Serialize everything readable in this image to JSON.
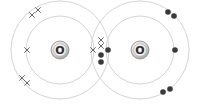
{
  "diagram": {
    "colors": {
      "background": "#ffffff",
      "shell": "#d4d4d4",
      "cross": "#555555",
      "dot": "#3a3a3a",
      "nucleus_fill": "#e6e6e6",
      "nucleus_stroke": "#8a8a8a"
    },
    "atoms": [
      {
        "id": "left",
        "symbol": "O",
        "center": [
          60,
          50
        ],
        "inner_shell_radius": 34,
        "outer_shell_radius": 49,
        "electron_symbol": "cross",
        "electrons": {
          "inner": [
            [
              27,
              50
            ],
            [
              93,
              50
            ]
          ],
          "outer": [
            [
              32,
              15
            ],
            [
              38,
              10
            ],
            [
              22,
              78
            ],
            [
              27,
              83
            ]
          ],
          "shared": [
            [
              101,
              40
            ],
            [
              101,
              46
            ]
          ]
        }
      },
      {
        "id": "right",
        "symbol": "O",
        "center": [
          140,
          50
        ],
        "inner_shell_radius": 34,
        "outer_shell_radius": 49,
        "electron_symbol": "dot",
        "electrons": {
          "inner": [
            [
              108,
              50
            ],
            [
              175,
              50
            ]
          ],
          "outer": [
            [
              168,
              12
            ],
            [
              174,
              16
            ],
            [
              163,
              92
            ],
            [
              170,
              89
            ]
          ],
          "shared": [
            [
              101,
              55
            ],
            [
              101,
              62
            ]
          ]
        }
      }
    ]
  }
}
